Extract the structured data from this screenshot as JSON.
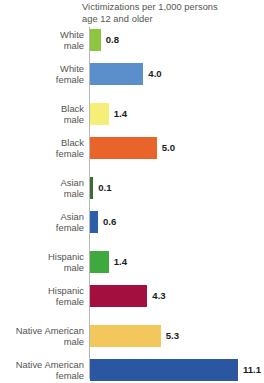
{
  "chart_data": {
    "type": "bar",
    "orientation": "horizontal",
    "title": "Victimizations per 1,000 persons\nage 12 and older",
    "xlabel": "",
    "ylabel": "",
    "xlim": [
      0,
      11.1
    ],
    "grid": false,
    "legend": "none",
    "categories": [
      "White\nmale",
      "White\nfemale",
      "Black\nmale",
      "Black\nfemale",
      "Asian\nmale",
      "Asian\nfemale",
      "Hispanic\nmale",
      "Hispanic\nfemale",
      "Native American\nmale",
      "Native American\nfemale"
    ],
    "values": [
      0.8,
      4.0,
      1.4,
      5.0,
      0.1,
      0.6,
      1.4,
      4.3,
      5.3,
      11.1
    ],
    "value_labels": [
      "0.8",
      "4.0",
      "1.4",
      "5.0",
      "0.1",
      "0.6",
      "1.4",
      "4.3",
      "5.3",
      "11.1"
    ],
    "colors": [
      "#8CC63E",
      "#5B8FCB",
      "#F5EE78",
      "#E8642A",
      "#3A6B35",
      "#2D5FA8",
      "#3FA83F",
      "#A31040",
      "#F2C75C",
      "#2B57A0"
    ]
  },
  "bars": [
    {
      "label": "White\nmale",
      "value": 0.8,
      "value_label": "0.8",
      "color": "#8CC63E"
    },
    {
      "label": "White\nfemale",
      "value": 4.0,
      "value_label": "4.0",
      "color": "#5B8FCB"
    },
    {
      "label": "Black\nmale",
      "value": 1.4,
      "value_label": "1.4",
      "color": "#F5EE78"
    },
    {
      "label": "Black\nfemale",
      "value": 5.0,
      "value_label": "5.0",
      "color": "#E8642A"
    },
    {
      "label": "Asian\nmale",
      "value": 0.1,
      "value_label": "0.1",
      "color": "#3A6B35"
    },
    {
      "label": "Asian\nfemale",
      "value": 0.6,
      "value_label": "0.6",
      "color": "#2D5FA8"
    },
    {
      "label": "Hispanic\nmale",
      "value": 1.4,
      "value_label": "1.4",
      "color": "#3FA83F"
    },
    {
      "label": "Hispanic\nfemale",
      "value": 4.3,
      "value_label": "4.3",
      "color": "#A31040"
    },
    {
      "label": "Native American\nmale",
      "value": 5.3,
      "value_label": "5.3",
      "color": "#F2C75C"
    },
    {
      "label": "Native American\nfemale",
      "value": 11.1,
      "value_label": "11.1",
      "color": "#2B57A0"
    }
  ],
  "axis": {
    "color": "#b9b7b3"
  },
  "layout": {
    "px_per_unit": 13.33,
    "axis_x": 90,
    "bar_height": 22,
    "row_tops": [
      2,
      36,
      76,
      110,
      150,
      184,
      224,
      258,
      298,
      332
    ]
  }
}
